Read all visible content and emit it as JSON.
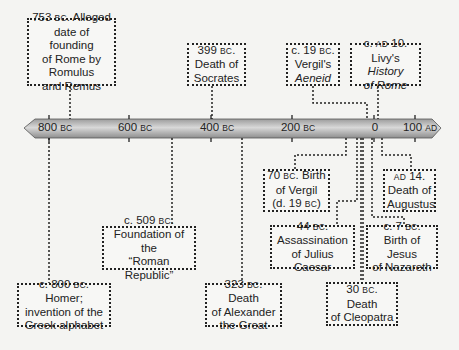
{
  "timeline": {
    "ticks": [
      {
        "value": "800",
        "era": "BC",
        "x": 49
      },
      {
        "value": "600",
        "era": "BC",
        "x": 129
      },
      {
        "value": "400",
        "era": "BC",
        "x": 211
      },
      {
        "value": "200",
        "era": "BC",
        "x": 292
      },
      {
        "value": "0",
        "era": "",
        "x": 374
      },
      {
        "value": "100",
        "era": "AD",
        "x": 415
      }
    ],
    "bar_color_light": "#d6d6d6",
    "bar_color_dark": "#9a9a9a"
  },
  "events_above": [
    {
      "id": "rome-founding",
      "lines": [
        "753 BC. Alleged",
        "date of founding",
        "of Rome by",
        "Romulus",
        "and Remus"
      ]
    },
    {
      "id": "socrates-death",
      "lines": [
        "399 BC.",
        "Death of",
        "Socrates"
      ]
    },
    {
      "id": "aeneid",
      "lines": [
        "c. 19 BC.",
        "Vergil's",
        "Aeneid"
      ]
    },
    {
      "id": "livy-history",
      "lines": [
        "c. AD 10.",
        "Livy's History",
        "of Rome"
      ]
    }
  ],
  "events_below": [
    {
      "id": "vergil-birth",
      "lines": [
        "70 BC. Birth",
        "of Vergil",
        "(d. 19 BC)"
      ]
    },
    {
      "id": "augustus-death",
      "lines": [
        "AD 14.",
        "Death of",
        "Augustus"
      ]
    },
    {
      "id": "roman-republic",
      "lines": [
        "c. 509 BC.",
        "Foundation of the",
        "“Roman Republic”"
      ]
    },
    {
      "id": "caesar-assassination",
      "lines": [
        "44 BC.",
        "Assassination",
        "of Julius Caesar"
      ]
    },
    {
      "id": "jesus-birth",
      "lines": [
        "c. 7 BC.",
        "Birth of Jesus",
        "of Nazareth"
      ]
    },
    {
      "id": "homer",
      "lines": [
        "c. 800 BC. Homer;",
        "invention of the",
        "Greek alphabet"
      ]
    },
    {
      "id": "alexander-death",
      "lines": [
        "323 BC. Death",
        "of Alexander",
        "the Great"
      ]
    },
    {
      "id": "cleopatra-death",
      "lines": [
        "30 BC. Death",
        "of Cleopatra"
      ]
    }
  ],
  "text": {
    "rome_year": "753",
    "rome_era": "BC",
    "rome_l1_rest": ". Alleged",
    "rome_l2": "date of founding",
    "rome_l3": "of Rome by",
    "rome_l4": "Romulus",
    "rome_l5": "and Remus",
    "soc_year": "399",
    "soc_era": "BC",
    "soc_l2": "Death of",
    "soc_l3": "Socrates",
    "aen_pre": "c. 19 ",
    "aen_era": "BC",
    "aen_l2": "Vergil's",
    "aen_l3": "Aeneid",
    "livy_pre": "c. ",
    "livy_era": "AD",
    "livy_year": " 10.",
    "livy_l2a": "Livy's ",
    "livy_l2b": "History",
    "livy_l3": "of Rome",
    "verg_year": "70 ",
    "verg_era": "BC",
    "verg_l1_rest": ". Birth",
    "verg_l2": "of Vergil",
    "verg_l3a": "(d. 19 ",
    "verg_l3_era": "BC",
    "verg_l3b": ")",
    "aug_era": "AD",
    "aug_year": " 14.",
    "aug_l2": "Death of",
    "aug_l3": "Augustus",
    "rep_pre": "c. 509 ",
    "rep_era": "BC",
    "rep_l2": "Foundation of the",
    "rep_l3": "“Roman Republic”",
    "caes_year": "44 ",
    "caes_era": "BC",
    "caes_l2": "Assassination",
    "caes_l3": "of Julius Caesar",
    "jes_pre": "c. 7 ",
    "jes_era": "BC",
    "jes_l2": "Birth of Jesus",
    "jes_l3": "of Nazareth",
    "hom_pre": "c. 800 ",
    "hom_era": "BC",
    "hom_rest": ". Homer;",
    "hom_l2": "invention of the",
    "hom_l3": "Greek alphabet",
    "alex_year": "323 ",
    "alex_era": "BC",
    "alex_rest": ". Death",
    "alex_l2": "of Alexander",
    "alex_l3": "the Great",
    "cleo_year": "30 ",
    "cleo_era": "BC",
    "cleo_rest": ". Death",
    "cleo_l2": "of Cleopatra",
    "dot": "."
  }
}
